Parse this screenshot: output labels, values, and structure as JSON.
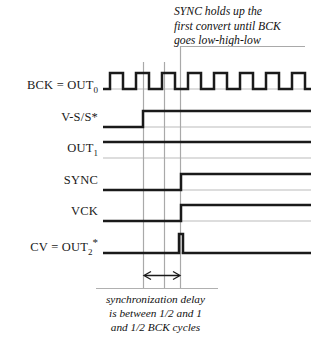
{
  "diagram": {
    "type": "digital-timing-diagram",
    "title_annotation": {
      "lines": [
        "SYNC holds up the",
        "first convert until BCK",
        "goes low-high-low"
      ]
    },
    "caption_annotation": {
      "lines": [
        "synchronization delay",
        "is between 1/2 and  1",
        "and 1/2 BCK cycles"
      ]
    },
    "signals": [
      {
        "id": "bck",
        "label_html": "BCK = OUT<sub>0</sub>",
        "label_text": "BCK = OUT0",
        "label_main": "BCK = OUT",
        "label_sub": "0",
        "label_star": "",
        "waveform": "clock",
        "description": "free running bit clock, eight pulses"
      },
      {
        "id": "vss",
        "label_html": "V-S/S*",
        "label_text": "V-S/S*",
        "label_main": "V-S/S*",
        "label_sub": "",
        "label_star": "",
        "waveform": "rising-edge",
        "description": "goes high at start of conversion request"
      },
      {
        "id": "out1",
        "label_html": "OUT<sub>1</sub>",
        "label_text": "OUT1",
        "label_main": "OUT",
        "label_sub": "1",
        "label_star": "",
        "waveform": "low",
        "description": "remains low"
      },
      {
        "id": "sync",
        "label_html": "SYNC",
        "label_text": "SYNC",
        "label_main": "SYNC",
        "label_sub": "",
        "label_star": "",
        "waveform": "rising-edge",
        "description": "rises after BCK low-high-low"
      },
      {
        "id": "vck",
        "label_html": "VCK",
        "label_text": "VCK",
        "label_main": "VCK",
        "label_sub": "",
        "label_star": "",
        "waveform": "rising-edge",
        "description": "rises with SYNC"
      },
      {
        "id": "cv",
        "label_html": "CV = OUT<sub>2</sub>*",
        "label_text": "CV = OUT2*",
        "label_main": "CV = OUT",
        "label_sub": "2",
        "label_star": "*",
        "waveform": "narrow-pulse",
        "description": "single narrow convert pulse"
      }
    ],
    "markers": {
      "count": 3,
      "labels": [
        "marker-left",
        "marker-middle",
        "marker-right"
      ]
    },
    "delay_arrow": {
      "style": "double-headed",
      "meaning": "synchronization delay"
    },
    "colors": {
      "trace": "#1a1a1a",
      "baseline": "#b8b8b8",
      "marker": "#a8a8a8",
      "background": "#ffffff",
      "text": "#111111"
    }
  }
}
